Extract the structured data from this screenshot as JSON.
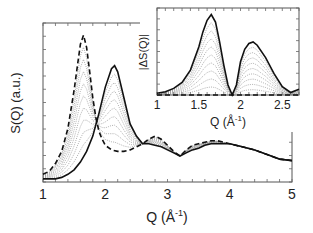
{
  "chart_data": [
    {
      "id": "main",
      "type": "line",
      "title": "",
      "xlabel": "Q (Å⁻¹)",
      "ylabel": "S(Q) (a.u.)",
      "xlim": [
        1,
        5
      ],
      "ylim": [
        0,
        1
      ],
      "xticks": [
        "1",
        "2",
        "3",
        "4",
        "5"
      ],
      "yticks": [],
      "grid": false,
      "legend": null,
      "series": [
        {
          "name": "initial (dashed)",
          "style": "dashed",
          "x": [
            1.0,
            1.1,
            1.2,
            1.3,
            1.4,
            1.5,
            1.55,
            1.6,
            1.65,
            1.7,
            1.75,
            1.8,
            1.85,
            1.9,
            1.95,
            2.0,
            2.1,
            2.2,
            2.3,
            2.4,
            2.5,
            2.6,
            2.7,
            2.8,
            2.9,
            3.0,
            3.1,
            3.2,
            3.3,
            3.4,
            3.5,
            3.6,
            3.7,
            3.8,
            3.9,
            4.0,
            4.2,
            4.4,
            4.6,
            4.8,
            5.0
          ],
          "y": [
            0.05,
            0.07,
            0.12,
            0.2,
            0.35,
            0.6,
            0.75,
            0.9,
            0.96,
            0.88,
            0.72,
            0.55,
            0.42,
            0.33,
            0.28,
            0.24,
            0.21,
            0.2,
            0.2,
            0.21,
            0.23,
            0.25,
            0.28,
            0.3,
            0.28,
            0.24,
            0.2,
            0.17,
            0.21,
            0.24,
            0.25,
            0.26,
            0.27,
            0.27,
            0.26,
            0.25,
            0.23,
            0.21,
            0.18,
            0.15,
            0.14
          ]
        },
        {
          "name": "final (solid)",
          "style": "solid",
          "x": [
            1.0,
            1.1,
            1.2,
            1.3,
            1.4,
            1.5,
            1.6,
            1.7,
            1.8,
            1.9,
            2.0,
            2.1,
            2.15,
            2.2,
            2.3,
            2.4,
            2.5,
            2.6,
            2.7,
            2.8,
            2.9,
            3.0,
            3.1,
            3.2,
            3.3,
            3.4,
            3.5,
            3.6,
            3.7,
            3.8,
            3.9,
            4.0,
            4.2,
            4.4,
            4.6,
            4.8,
            5.0
          ],
          "y": [
            0.02,
            0.02,
            0.02,
            0.03,
            0.05,
            0.08,
            0.13,
            0.2,
            0.3,
            0.45,
            0.62,
            0.74,
            0.76,
            0.72,
            0.55,
            0.38,
            0.3,
            0.25,
            0.25,
            0.24,
            0.23,
            0.21,
            0.19,
            0.17,
            0.19,
            0.21,
            0.22,
            0.24,
            0.25,
            0.25,
            0.25,
            0.25,
            0.23,
            0.21,
            0.18,
            0.15,
            0.14
          ]
        }
      ],
      "intermediate_curves": 9,
      "annotations": [
        "dotted intermediate curves between dashed and solid"
      ]
    },
    {
      "id": "inset",
      "type": "line",
      "title": "",
      "xlabel": "Q (Å⁻¹)",
      "ylabel": "|ΔS(Q)|",
      "xlim": [
        1,
        2.7
      ],
      "ylim": [
        0,
        1
      ],
      "xticks": [
        "1",
        "1.5",
        "2",
        "2.5"
      ],
      "yticks": [],
      "grid": false,
      "series": [
        {
          "name": "max difference (solid)",
          "style": "solid",
          "x": [
            1.0,
            1.1,
            1.2,
            1.3,
            1.4,
            1.5,
            1.55,
            1.6,
            1.65,
            1.7,
            1.75,
            1.8,
            1.85,
            1.9,
            1.95,
            2.0,
            2.05,
            2.1,
            2.15,
            2.2,
            2.3,
            2.4,
            2.5,
            2.6,
            2.7
          ],
          "y": [
            0.02,
            0.04,
            0.08,
            0.15,
            0.3,
            0.58,
            0.76,
            0.9,
            0.97,
            0.88,
            0.64,
            0.36,
            0.12,
            0.0,
            0.12,
            0.4,
            0.55,
            0.62,
            0.64,
            0.6,
            0.45,
            0.26,
            0.1,
            0.03,
            0.07
          ]
        },
        {
          "name": "baseline (dashed)",
          "style": "dashed",
          "x": [
            1.0,
            2.7
          ],
          "y": [
            0.0,
            0.0
          ]
        }
      ],
      "intermediate_curves": 9
    }
  ],
  "main": {
    "xlabel": "Q (Å",
    "xlabel_sup": "-1",
    "xlabel_close": ")",
    "ylabel": "S(Q) (a.u.)",
    "xticks": [
      "1",
      "2",
      "3",
      "4",
      "5"
    ]
  },
  "inset": {
    "xlabel": "Q (Å",
    "xlabel_sup": "-1",
    "xlabel_close": ")",
    "ylabel": "|ΔS(Q)|",
    "xticks": [
      "1",
      "1.5",
      "2",
      "2.5"
    ]
  }
}
